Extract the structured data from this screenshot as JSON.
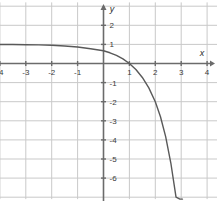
{
  "chart_data": {
    "type": "line",
    "title": "",
    "subtitle": "",
    "xlabel": "x",
    "ylabel": "y",
    "function": "y = 1 - 3^(x-1)",
    "xlim": [
      -4.85,
      4.45
    ],
    "ylim": [
      -7.1,
      3.2
    ],
    "grid": true,
    "grid_spacing": 1,
    "legend": "none",
    "annotations": [],
    "xticks": [
      -4,
      -3,
      -2,
      -1,
      1,
      2,
      3,
      4
    ],
    "xtick_labels": [
      "-4",
      "-3",
      "-2",
      "-1",
      "1",
      "2",
      "3",
      "4"
    ],
    "yticks": [
      2,
      1,
      -1,
      -2,
      -3,
      -4,
      -5,
      -6
    ],
    "ytick_labels": [
      "2",
      "1",
      "-1",
      "-2",
      "-3",
      "-4",
      "-5",
      "-6"
    ],
    "series": [
      {
        "name": "y = 1 - 3^(x-1)",
        "color": "#595959",
        "x": [
          -4.85,
          -4.5,
          -4.0,
          -3.5,
          -3.0,
          -2.5,
          -2.0,
          -1.5,
          -1.0,
          -0.5,
          0.0,
          0.25,
          0.5,
          0.75,
          1.0,
          1.25,
          1.5,
          1.75,
          2.0,
          2.2,
          2.4,
          2.6,
          2.8,
          2.95,
          3.05
        ],
        "y": [
          0.998,
          0.997,
          0.995,
          0.991,
          0.984,
          0.973,
          0.954,
          0.92,
          0.867,
          0.769,
          0.667,
          0.561,
          0.423,
          0.241,
          0.0,
          -0.316,
          -0.732,
          -1.277,
          -2.0,
          -2.79,
          -3.83,
          -5.21,
          -7.0,
          -7.1,
          -7.1
        ]
      }
    ],
    "colors": {
      "curve": "#595959",
      "axis": "#6b6b6b",
      "grid": "#c9c9c9",
      "tick_text": "#3a3a3a",
      "background": "#ffffff"
    }
  },
  "axis_labels": {
    "x": "x",
    "y": "y"
  }
}
